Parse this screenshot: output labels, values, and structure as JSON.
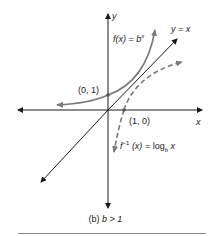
{
  "figure": {
    "caption_prefix": "(b)",
    "caption_condition": "b > 1",
    "axis_labels": {
      "x": "x",
      "y": "y"
    },
    "line_label": "y = x",
    "exp_label": {
      "name": "f(x)",
      "eq": "=",
      "base": "b",
      "exp": "x"
    },
    "log_label": {
      "name": "f",
      "sup": "−1",
      "arg": "(x)",
      "eq": "=",
      "log": "log",
      "sub": "b",
      "var": "x"
    },
    "points": [
      {
        "label": "(0, 1)"
      },
      {
        "label": "(1, 0)"
      }
    ],
    "colors": {
      "axes": "#1a1a1a",
      "curves": "#7a7a7a",
      "rule": "#888888"
    }
  }
}
